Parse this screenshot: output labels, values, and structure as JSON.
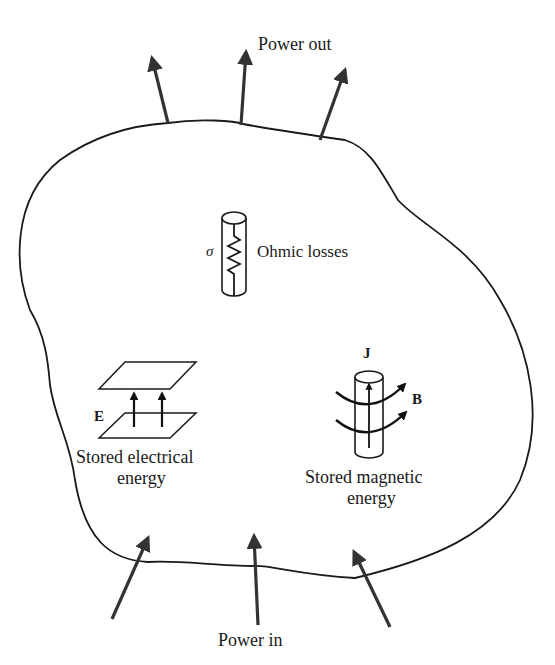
{
  "diagram": {
    "type": "energy-flow-volume",
    "labels": {
      "power_out": "Power out",
      "power_in": "Power in",
      "ohmic_losses": "Ohmic losses",
      "sigma": "σ",
      "e_field": "E",
      "stored_electrical_line1": "Stored electrical",
      "stored_electrical_line2": "energy",
      "current_density": "J",
      "magnetic_field": "B",
      "stored_magnetic_line1": "Stored magnetic",
      "stored_magnetic_line2": "energy"
    },
    "arrows": {
      "out_count": 3,
      "in_count": 3
    },
    "colors": {
      "stroke": "#1a1a1a",
      "arrow": "#333333",
      "background": "#ffffff"
    }
  }
}
